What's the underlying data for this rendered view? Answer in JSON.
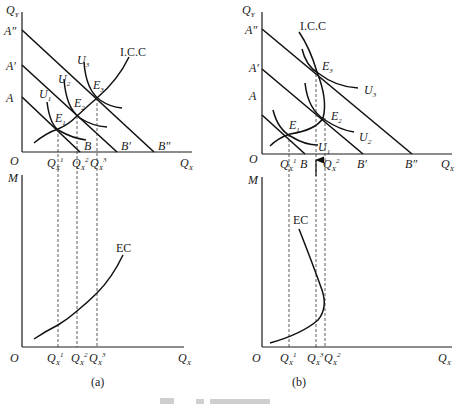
{
  "panels": [
    {
      "id": "a",
      "caption": "(a)",
      "top": {
        "y_axis_label": "Q",
        "y_axis_sub": "Y",
        "x_axis_label": "Q",
        "x_axis_sub": "X",
        "origin_label": "O",
        "intercepts_y": [
          "A",
          "A′",
          "A″"
        ],
        "intercepts_x": [
          "B",
          "B′",
          "B″"
        ],
        "indifference_curves": [
          "U",
          "U",
          "U"
        ],
        "indifference_subs": [
          "1",
          "2",
          "3"
        ],
        "equilibria": [
          "E",
          "E",
          "E"
        ],
        "equilibria_subs": [
          "1",
          "2",
          "3"
        ],
        "path_label": "I.C.C",
        "quantity_ticks": [
          {
            "label": "Q",
            "sub": "X",
            "sup": "1"
          },
          {
            "label": "Q",
            "sub": "X",
            "sup": "2"
          },
          {
            "label": "Q",
            "sub": "X",
            "sup": "3"
          }
        ]
      },
      "bottom": {
        "y_axis_label": "M",
        "x_axis_label": "Q",
        "x_axis_sub": "X",
        "origin_label": "O",
        "curve_label": "EC",
        "quantity_ticks": [
          {
            "label": "Q",
            "sub": "X",
            "sup": "1"
          },
          {
            "label": "Q",
            "sub": "X",
            "sup": "2"
          },
          {
            "label": "Q",
            "sub": "X",
            "sup": "3"
          }
        ]
      }
    },
    {
      "id": "b",
      "caption": "(b)",
      "top": {
        "y_axis_label": "Q",
        "y_axis_sub": "Y",
        "x_axis_label": "Q",
        "x_axis_sub": "X",
        "origin_label": "O",
        "intercepts_y": [
          "A",
          "A′",
          "A″"
        ],
        "intercepts_x": [
          "B",
          "B′",
          "B″"
        ],
        "indifference_curves": [
          "U",
          "U",
          "U"
        ],
        "indifference_subs": [
          "1",
          "2",
          "3"
        ],
        "equilibria": [
          "E",
          "E",
          "E"
        ],
        "equilibria_subs": [
          "1",
          "2",
          "3"
        ],
        "path_label": "I.C.C",
        "quantity_ticks": [
          {
            "label": "Q",
            "sub": "X",
            "sup": "1"
          },
          {
            "label": "Q",
            "sub": "X",
            "sup": "2"
          }
        ]
      },
      "bottom": {
        "y_axis_label": "M",
        "x_axis_label": "Q",
        "x_axis_sub": "X",
        "origin_label": "O",
        "curve_label": "EC",
        "quantity_ticks": [
          {
            "label": "Q",
            "sub": "X",
            "sup": "1"
          },
          {
            "label": "Q",
            "sub": "X",
            "sup": "3"
          },
          {
            "label": "Q",
            "sub": "X",
            "sup": "2"
          }
        ]
      }
    }
  ]
}
